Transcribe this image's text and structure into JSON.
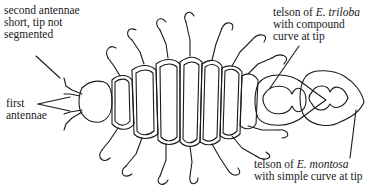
{
  "diagram": {
    "labels": {
      "second_antennae": [
        "second antennae",
        "short, tip not",
        "segmented"
      ],
      "first_antennae": [
        "first",
        "antennae"
      ],
      "telson_triloba": {
        "prefix": "telson of ",
        "species": "E. triloba",
        "lines": [
          "with compound",
          "curve at tip"
        ]
      },
      "telson_montosa": {
        "prefix": "telson of ",
        "species": "E. montosa",
        "lines": [
          "with simple curve at tip"
        ]
      }
    },
    "colors": {
      "ink": "#1a1a1a",
      "background": "#ffffff"
    }
  }
}
